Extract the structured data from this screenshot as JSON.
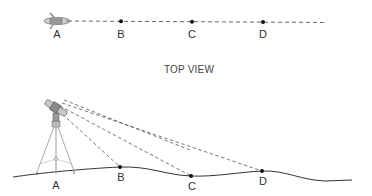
{
  "top_view": {
    "title": "TOP VIEW",
    "points": [
      {
        "label": "A",
        "role": "instrument"
      },
      {
        "label": "B"
      },
      {
        "label": "C"
      },
      {
        "label": "D"
      }
    ]
  },
  "side_view": {
    "points": [
      {
        "label": "A",
        "role": "tripod-station"
      },
      {
        "label": "B"
      },
      {
        "label": "C"
      },
      {
        "label": "D"
      }
    ]
  },
  "colors": {
    "line": "#555555",
    "dot": "#111111",
    "text": "#333333",
    "instrument": "#888888"
  }
}
